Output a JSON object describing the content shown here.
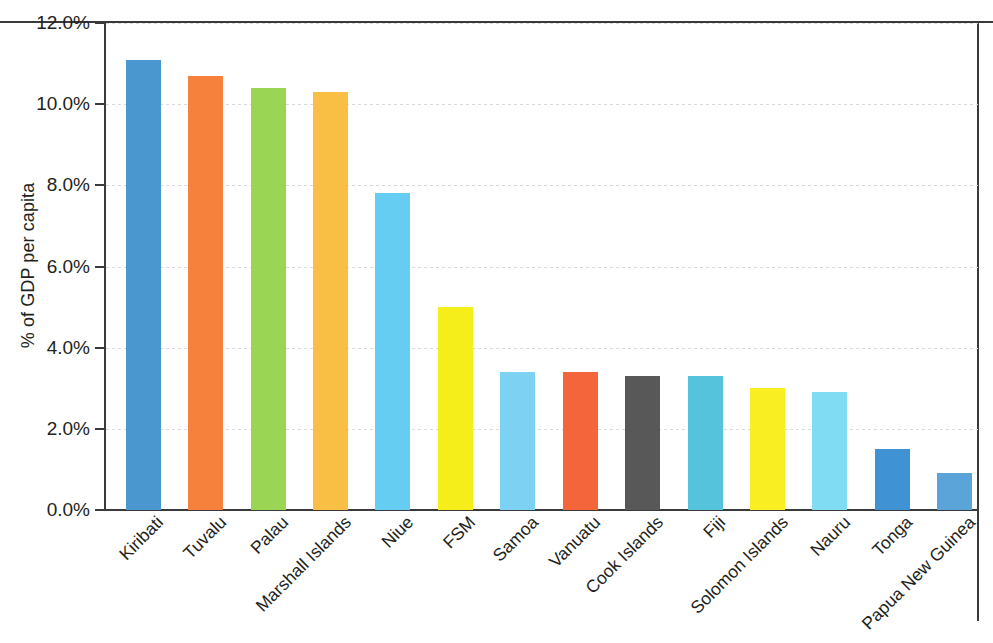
{
  "chart_data": {
    "type": "bar",
    "title": "",
    "subtitle": "",
    "xlabel": "",
    "ylabel": "% of GDP per capita",
    "ylim": [
      0,
      12
    ],
    "y_unit": "%",
    "grid": true,
    "legend": "none",
    "y_ticks": [
      {
        "value": 0,
        "label": "0.0%"
      },
      {
        "value": 2,
        "label": "2.0%"
      },
      {
        "value": 4,
        "label": "4.0%"
      },
      {
        "value": 6,
        "label": "6.0%"
      },
      {
        "value": 8,
        "label": "8.0%"
      },
      {
        "value": 10,
        "label": "10.0%"
      },
      {
        "value": 12,
        "label": "12.0%"
      }
    ],
    "categories": [
      "Kiribati",
      "Tuvalu",
      "Palau",
      "Marshall Islands",
      "Niue",
      "FSM",
      "Samoa",
      "Vanuatu",
      "Cook Islands",
      "Fiji",
      "Solomon Islands",
      "Nauru",
      "Tonga",
      "Papua New Guinea"
    ],
    "values": [
      11.1,
      10.7,
      10.4,
      10.3,
      7.8,
      5.0,
      3.4,
      3.4,
      3.3,
      3.3,
      3.0,
      2.9,
      1.5,
      0.9
    ],
    "colors": [
      "#4a96cf",
      "#f5813c",
      "#9ad653",
      "#f9bf45",
      "#66cdf2",
      "#f6ee1b",
      "#7dd2f3",
      "#f4653c",
      "#585858",
      "#56c3dd",
      "#f9ee21",
      "#7fdcf2",
      "#3f93d4",
      "#5ba4da"
    ]
  }
}
